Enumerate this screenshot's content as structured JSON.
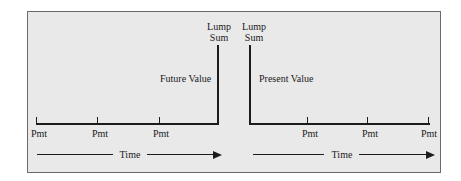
{
  "diagram": {
    "left_panel": {
      "top_label_line1": "Lump",
      "top_label_line2": "Sum",
      "value_label": "Future Value",
      "payments": [
        "Pmt",
        "Pmt",
        "Pmt"
      ],
      "axis_label": "Time"
    },
    "right_panel": {
      "top_label_line1": "Lump",
      "top_label_line2": "Sum",
      "value_label": "Present Value",
      "payments": [
        "Pmt",
        "Pmt",
        "Pmt"
      ],
      "axis_label": "Time"
    },
    "colors": {
      "background": "#e9e9e9",
      "line": "#1c1c1c",
      "border": "#6a6a6a"
    }
  }
}
